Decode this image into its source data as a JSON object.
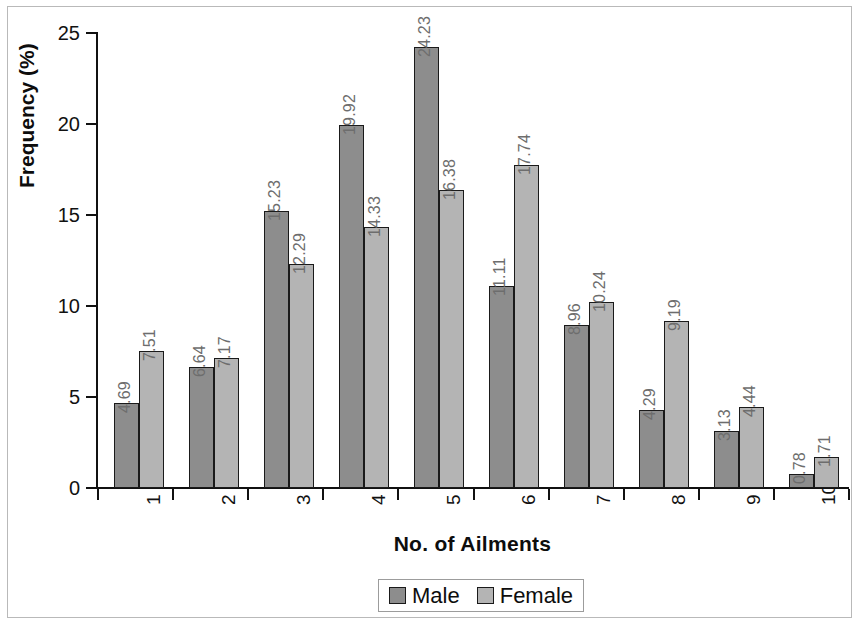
{
  "chart_data": {
    "type": "bar",
    "title": "",
    "xlabel": "No. of  Ailments",
    "ylabel": "Frequency (%)",
    "categories": [
      "1",
      "2",
      "3",
      "4",
      "5",
      "6",
      "7",
      "8",
      "9",
      "10"
    ],
    "series": [
      {
        "name": "Male",
        "color": "#8d8d8d",
        "values": [
          4.69,
          6.64,
          15.23,
          19.92,
          24.23,
          11.11,
          8.96,
          4.29,
          3.13,
          0.78
        ],
        "labels": [
          "4.69",
          "6.64",
          "15.23",
          "19.92",
          "24.23",
          "11.11",
          "8.96",
          "4.29",
          "3.13",
          "0.78"
        ]
      },
      {
        "name": "Female",
        "color": "#b4b4b4",
        "values": [
          7.51,
          7.17,
          12.29,
          14.33,
          16.38,
          17.74,
          10.24,
          9.19,
          4.44,
          1.71
        ],
        "labels": [
          "7.51",
          "7.17",
          "12.29",
          "14.33",
          "16.38",
          "17.74",
          "10.24",
          "9.19",
          "4.44",
          "1.71"
        ]
      }
    ],
    "ylim": [
      0,
      25
    ],
    "y_ticks": [
      0,
      5,
      10,
      15,
      20,
      25
    ],
    "y_tick_labels": [
      "0",
      "5",
      "10",
      "15",
      "20",
      "25"
    ],
    "grid": false,
    "legend_position": "bottom-center",
    "data_labels_rotation": 90,
    "x_tick_labels_rotation": 90,
    "label_color": "#6d6d6d",
    "axis_color": "#111111",
    "background": "#ffffff"
  },
  "legend": {
    "entries": [
      {
        "label": "Male",
        "swatch": "male"
      },
      {
        "label": "Female",
        "swatch": "female"
      }
    ]
  }
}
